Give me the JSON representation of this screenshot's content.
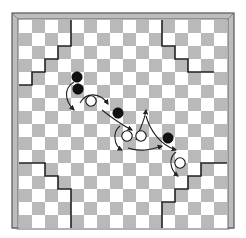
{
  "board": {
    "size": 16,
    "cell": 13,
    "origin": [
      19,
      20
    ],
    "frame": {
      "outer": [
        12,
        13,
        222,
        215
      ],
      "color_dark": "#555555",
      "color_fill": "#bdbdbd"
    },
    "colors": {
      "light": "#ffffff",
      "dark": "#b9b9b9",
      "line": "#222222"
    },
    "first_cell_light": true
  },
  "regions": [
    {
      "name": "top-left-staircase",
      "path": [
        [
          4,
          0
        ],
        [
          4,
          2
        ],
        [
          3,
          2
        ],
        [
          3,
          3
        ],
        [
          2,
          3
        ],
        [
          2,
          4
        ],
        [
          1,
          4
        ],
        [
          1,
          5
        ],
        [
          0,
          5
        ]
      ]
    },
    {
      "name": "top-right-staircase",
      "path": [
        [
          11,
          0
        ],
        [
          11,
          2
        ],
        [
          12,
          2
        ],
        [
          12,
          3
        ],
        [
          13,
          3
        ],
        [
          13,
          4
        ],
        [
          15,
          4
        ]
      ]
    },
    {
      "name": "bottom-left-staircase",
      "path": [
        [
          0,
          11
        ],
        [
          2,
          11
        ],
        [
          2,
          12
        ],
        [
          3,
          12
        ],
        [
          3,
          13
        ],
        [
          4,
          13
        ],
        [
          4,
          16
        ]
      ]
    },
    {
      "name": "bottom-right-staircase",
      "path": [
        [
          16,
          11
        ],
        [
          14,
          11
        ],
        [
          14,
          12
        ],
        [
          13,
          12
        ],
        [
          13,
          13
        ],
        [
          12,
          13
        ],
        [
          12,
          14
        ],
        [
          11,
          14
        ],
        [
          11,
          16
        ]
      ]
    }
  ],
  "pieces": [
    {
      "color": "black",
      "x": 77,
      "y": 77
    },
    {
      "color": "black",
      "x": 78,
      "y": 89
    },
    {
      "color": "white",
      "x": 91,
      "y": 101
    },
    {
      "color": "black",
      "x": 118,
      "y": 113
    },
    {
      "color": "white",
      "x": 127,
      "y": 136
    },
    {
      "color": "white",
      "x": 141,
      "y": 136
    },
    {
      "color": "black",
      "x": 168,
      "y": 138
    },
    {
      "color": "white",
      "x": 180,
      "y": 163
    }
  ],
  "arrows": [
    {
      "name": "arc-left-of-black-pair",
      "d": "M74 82 C 64 88, 64 100, 74 110"
    },
    {
      "name": "arc-over-white-1",
      "d": "M80 103 C 86 92, 100 92, 108 104"
    },
    {
      "name": "arc-down-to-right",
      "d": "M102 110 C 112 118, 120 124, 132 130"
    },
    {
      "name": "arc-left-of-white-2",
      "d": "M120 126 C 112 132, 114 146, 122 150"
    },
    {
      "name": "arc-under-white-pair",
      "d": "M128 148 C 140 152, 150 150, 162 146"
    },
    {
      "name": "arc-up-from-pair",
      "d": "M136 140 C 140 128, 145 120, 146 110"
    },
    {
      "name": "arc-down-from-pair",
      "d": "M146 116 C 150 130, 160 145, 176 150"
    },
    {
      "name": "arc-left-of-white-4",
      "d": "M176 152 C 168 158, 170 170, 178 176"
    }
  ]
}
